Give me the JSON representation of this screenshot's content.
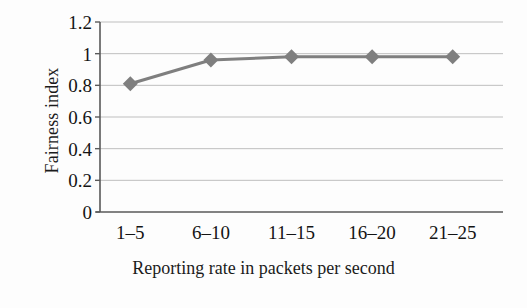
{
  "chart_data": {
    "type": "line",
    "title": "",
    "xlabel": "Reporting rate in packets per second",
    "ylabel": "Fairness index",
    "categories": [
      "1–5",
      "6–10",
      "11–15",
      "16–20",
      "21–25"
    ],
    "values": [
      0.81,
      0.96,
      0.98,
      0.98,
      0.98
    ],
    "series": [
      {
        "name": "Fairness index",
        "values": [
          0.81,
          0.96,
          0.98,
          0.98,
          0.98
        ]
      }
    ],
    "ylim": [
      0,
      1.2
    ],
    "ytick_labels": [
      "1.2",
      "1",
      "0.8",
      "0.6",
      "0.4",
      "0.2",
      "0"
    ],
    "ytick_values": [
      1.2,
      1.0,
      0.8,
      0.6,
      0.4,
      0.2,
      0
    ],
    "grid": true,
    "legend": "none",
    "marker": "diamond",
    "series_color": "#7f7f7f",
    "grid_color": "#bfbfbf",
    "axis_color": "#595959",
    "text_color": "#141414",
    "background_color": "#fdfdfd"
  }
}
